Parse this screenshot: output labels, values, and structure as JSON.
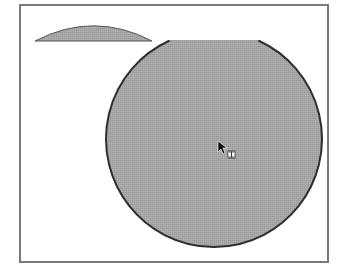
{
  "canvas": {
    "width": 339,
    "height": 275,
    "background": "#ffffff"
  },
  "frame": {
    "x": 20,
    "y": 5,
    "width": 308,
    "height": 257,
    "stroke": "#7a7a7a"
  },
  "shapes": {
    "main_circle": {
      "cx": 214,
      "cy": 139,
      "r": 108,
      "clip_top_y": 41,
      "fill": "#a3a3a3",
      "stroke": "#2e2e2e"
    },
    "cut_cap": {
      "x_start": 35,
      "x_end": 152,
      "base_y": 41,
      "top_y": 25,
      "fill": "#a3a3a3",
      "stroke": "#555555"
    }
  },
  "cursor": {
    "icon": "arrow-pointer-with-move-glyph",
    "x": 218,
    "y": 141
  }
}
